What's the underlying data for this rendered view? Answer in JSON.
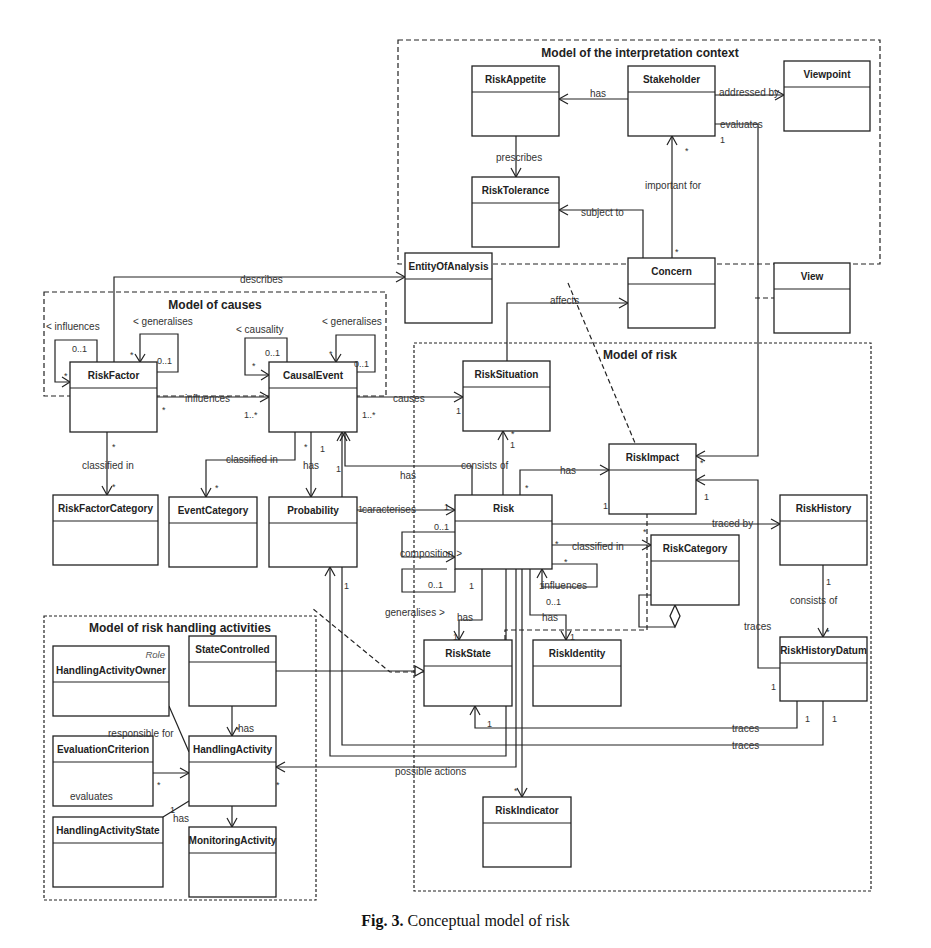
{
  "caption": {
    "label": "Fig. 3.",
    "text": "Conceptual model of risk"
  },
  "packages": [
    {
      "id": "ctx",
      "title": "Model of the interpretation context",
      "x": 398,
      "y": 40,
      "w": 482,
      "h": 224,
      "style": "dash",
      "tx": 640,
      "ty": 57
    },
    {
      "id": "causes",
      "title": "Model of causes",
      "x": 44,
      "y": 292,
      "w": 342,
      "h": 104,
      "style": "dash",
      "tx": 215,
      "ty": 309
    },
    {
      "id": "risk",
      "title": "Model of risk",
      "x": 414,
      "y": 343,
      "w": 457,
      "h": 548,
      "style": "dot",
      "tx": 640,
      "ty": 359
    },
    {
      "id": "handling",
      "title": "Model of risk handling activities",
      "x": 44,
      "y": 616,
      "w": 272,
      "h": 284,
      "style": "dot",
      "tx": 180,
      "ty": 632
    }
  ],
  "classes": [
    {
      "id": "RiskAppetite",
      "name": "RiskAppetite",
      "x": 472,
      "y": 66,
      "w": 87,
      "h": 70
    },
    {
      "id": "Stakeholder",
      "name": "Stakeholder",
      "x": 628,
      "y": 66,
      "w": 87,
      "h": 70
    },
    {
      "id": "Viewpoint",
      "name": "Viewpoint",
      "x": 784,
      "y": 61,
      "w": 86,
      "h": 70
    },
    {
      "id": "RiskTolerance",
      "name": "RiskTolerance",
      "x": 472,
      "y": 177,
      "w": 87,
      "h": 70
    },
    {
      "id": "EntityOfAnalysis",
      "name": "EntityOfAnalysis",
      "x": 405,
      "y": 253,
      "w": 87,
      "h": 70
    },
    {
      "id": "Concern",
      "name": "Concern",
      "x": 628,
      "y": 258,
      "w": 87,
      "h": 70
    },
    {
      "id": "View",
      "name": "View",
      "x": 774,
      "y": 263,
      "w": 76,
      "h": 70
    },
    {
      "id": "RiskFactor",
      "name": "RiskFactor",
      "x": 70,
      "y": 362,
      "w": 87,
      "h": 70
    },
    {
      "id": "CausalEvent",
      "name": "CausalEvent",
      "x": 269,
      "y": 362,
      "w": 88,
      "h": 70
    },
    {
      "id": "RiskSituation",
      "name": "RiskSituation",
      "x": 463,
      "y": 361,
      "w": 87,
      "h": 70
    },
    {
      "id": "RiskImpact",
      "name": "RiskImpact",
      "x": 609,
      "y": 444,
      "w": 87,
      "h": 70
    },
    {
      "id": "RiskFactorCategory",
      "name": "RiskFactorCategory",
      "x": 53,
      "y": 495,
      "w": 105,
      "h": 70
    },
    {
      "id": "EventCategory",
      "name": "EventCategory",
      "x": 169,
      "y": 497,
      "w": 88,
      "h": 70
    },
    {
      "id": "Probability",
      "name": "Probability",
      "x": 269,
      "y": 497,
      "w": 88,
      "h": 70
    },
    {
      "id": "Risk",
      "name": "Risk",
      "x": 455,
      "y": 495,
      "w": 97,
      "h": 74
    },
    {
      "id": "RiskHistory",
      "name": "RiskHistory",
      "x": 780,
      "y": 495,
      "w": 87,
      "h": 70
    },
    {
      "id": "RiskCategory",
      "name": "RiskCategory",
      "x": 651,
      "y": 535,
      "w": 88,
      "h": 70
    },
    {
      "id": "RiskState",
      "name": "RiskState",
      "x": 424,
      "y": 640,
      "w": 88,
      "h": 66
    },
    {
      "id": "RiskIdentity",
      "name": "RiskIdentity",
      "x": 533,
      "y": 640,
      "w": 88,
      "h": 66
    },
    {
      "id": "RiskHistoryDatum",
      "name": "RiskHistoryDatum",
      "x": 780,
      "y": 637,
      "w": 87,
      "h": 64
    },
    {
      "id": "HandlingActivityOwner",
      "name": "HandlingActivityOwner",
      "stereotype": "Role",
      "x": 53,
      "y": 646,
      "w": 116,
      "h": 70
    },
    {
      "id": "StateControlled",
      "name": "StateControlled",
      "x": 189,
      "y": 636,
      "w": 87,
      "h": 70
    },
    {
      "id": "EvaluationCriterion",
      "name": "EvaluationCriterion",
      "x": 53,
      "y": 736,
      "w": 100,
      "h": 70
    },
    {
      "id": "HandlingActivity",
      "name": "HandlingActivity",
      "x": 189,
      "y": 736,
      "w": 87,
      "h": 70
    },
    {
      "id": "HandlingActivityState",
      "name": "HandlingActivityState",
      "x": 53,
      "y": 817,
      "w": 110,
      "h": 70
    },
    {
      "id": "MonitoringActivity",
      "name": "MonitoringActivity",
      "x": 189,
      "y": 827,
      "w": 87,
      "h": 70
    },
    {
      "id": "RiskIndicator",
      "name": "RiskIndicator",
      "x": 483,
      "y": 797,
      "w": 88,
      "h": 70
    }
  ],
  "associations": [
    {
      "label": "has",
      "lx": 590,
      "ly": 88,
      "path": "M628,99 L559,99",
      "arrow": "open",
      "ax": 559,
      "ay": 99,
      "dir": "left"
    },
    {
      "label": "addressed by",
      "lx": 719,
      "ly": 87,
      "path": "M715,95 L784,95",
      "arrow": "open",
      "ax": 784,
      "ay": 95,
      "dir": "right"
    },
    {
      "label": "evaluates",
      "lx": 720,
      "ly": 119,
      "path": "M715,124 L758,124 L758,456 L696,456",
      "arrow": "open",
      "ax": 696,
      "ay": 456,
      "dir": "left"
    },
    {
      "label": "prescribes",
      "lx": 496,
      "ly": 152,
      "path": "M516,136 L516,177",
      "arrow": "open",
      "ax": 516,
      "ay": 177,
      "dir": "down"
    },
    {
      "label": "important for",
      "lx": 645,
      "ly": 180,
      "path": "M672,258 L672,136",
      "arrow": "open",
      "ax": 672,
      "ay": 136,
      "dir": "up"
    },
    {
      "label": "subject to",
      "lx": 581,
      "ly": 207,
      "path": "M643,258 L643,210 L559,210",
      "arrow": "open",
      "ax": 559,
      "ay": 210,
      "dir": "left"
    },
    {
      "label": "describes",
      "lx": 240,
      "ly": 274,
      "path": "M114,362 L114,277 L405,277",
      "arrow": "open",
      "ax": 405,
      "ay": 277,
      "dir": "right"
    },
    {
      "label": "affects",
      "lx": 550,
      "ly": 295,
      "path": "M507,361 L507,303 L628,303",
      "arrow": "open",
      "ax": 628,
      "ay": 303,
      "dir": "right"
    },
    {
      "label": "influences",
      "lx": 185,
      "ly": 393,
      "path": "M157,397 L269,397",
      "arrow": "open",
      "ax": 269,
      "ay": 397,
      "dir": "right"
    },
    {
      "label": "causes",
      "lx": 393,
      "ly": 393,
      "path": "M357,397 L463,397",
      "arrow": "open",
      "ax": 463,
      "ay": 397,
      "dir": "right"
    },
    {
      "label": "classified in",
      "lx": 82,
      "ly": 460,
      "path": "M107,432 L107,495",
      "arrow": "open",
      "ax": 107,
      "ay": 495,
      "dir": "down"
    },
    {
      "label": "classified in",
      "lx": 226,
      "ly": 454,
      "path": "M295,432 L295,460 L206,460 L206,497",
      "arrow": "open",
      "ax": 206,
      "ay": 497,
      "dir": "down"
    },
    {
      "label": "has",
      "lx": 303,
      "ly": 460,
      "path": "M311,432 L311,497",
      "arrow": "open",
      "ax": 311,
      "ay": 497,
      "dir": "down"
    },
    {
      "label": "has",
      "lx": 400,
      "ly": 470,
      "path": "M472,495 L472,466 L345,466 L345,432",
      "arrow": "open",
      "ax": 345,
      "ay": 432,
      "dir": "up"
    },
    {
      "label": "consists of",
      "lx": 461,
      "ly": 460,
      "path": "M503,495 L503,431",
      "arrow": "open",
      "ax": 503,
      "ay": 431,
      "dir": "up"
    },
    {
      "label": "has",
      "lx": 560,
      "ly": 465,
      "path": "M520,495 L520,470 L609,470",
      "arrow": "open",
      "ax": 609,
      "ay": 470,
      "dir": "right"
    },
    {
      "label": "caracterises",
      "lx": 362,
      "ly": 504,
      "path": "M357,510 L455,510",
      "arrow": "open",
      "ax": 455,
      "ay": 510,
      "dir": "right"
    },
    {
      "label": "traced by",
      "lx": 712,
      "ly": 518,
      "path": "M552,524 L780,524",
      "arrow": "open",
      "ax": 780,
      "ay": 524,
      "dir": "right"
    },
    {
      "label": "classified in",
      "lx": 572,
      "ly": 541,
      "path": "M552,545 L651,545",
      "arrow": "open",
      "ax": 651,
      "ay": 545,
      "dir": "right"
    },
    {
      "label": "composition >",
      "lx": 400,
      "ly": 548,
      "path": "M455,532 L402,532 L402,557 L455,557",
      "arrow": "open",
      "ax": 455,
      "ay": 557,
      "dir": "right"
    },
    {
      "label": "influences",
      "lx": 542,
      "ly": 580,
      "path": "M552,564 L597,564 L597,587 L542,587 L542,569",
      "arrow": "open",
      "ax": 542,
      "ay": 569,
      "dir": "up"
    },
    {
      "label": "generalises >",
      "lx": 385,
      "ly": 607,
      "path": "M455,569 L455,592 L402,592 L402,569 L447,569",
      "arrow": "none"
    },
    {
      "label": "has",
      "lx": 457,
      "ly": 612,
      "path": "M482,569 L482,620 L459,620 L459,640",
      "arrow": "open",
      "ax": 459,
      "ay": 640,
      "dir": "down"
    },
    {
      "label": "has",
      "lx": 542,
      "ly": 612,
      "path": "M530,569 L530,615 L566,615 L566,640",
      "arrow": "open",
      "ax": 566,
      "ay": 640,
      "dir": "down"
    },
    {
      "label": "consists of",
      "lx": 790,
      "ly": 595,
      "path": "M823,565 L823,637",
      "arrow": "open",
      "ax": 823,
      "ay": 637,
      "dir": "down"
    },
    {
      "label": "traces",
      "lx": 744,
      "ly": 621,
      "path": "M780,668 L758,668 L758,480 L696,480",
      "arrow": "open",
      "ax": 696,
      "ay": 480,
      "dir": "left"
    },
    {
      "label": "traces",
      "lx": 732,
      "ly": 723,
      "path": "M797,701 L797,728 L475,728 L475,706",
      "arrow": "open",
      "ax": 475,
      "ay": 706,
      "dir": "up"
    },
    {
      "label": "traces",
      "lx": 732,
      "ly": 740,
      "path": "M823,701 L823,745 L342,745 L342,432",
      "arrow": "open",
      "ax": 342,
      "ay": 432,
      "dir": "up"
    },
    {
      "label": "possible actions",
      "lx": 395,
      "ly": 766,
      "path": "M516,569 L516,767 L276,767",
      "arrow": "open",
      "ax": 276,
      "ay": 767,
      "dir": "left"
    },
    {
      "label": "",
      "lx": 0,
      "ly": 0,
      "path": "M522,569 L522,797",
      "arrow": "open",
      "ax": 522,
      "ay": 797,
      "dir": "down"
    },
    {
      "label": "",
      "lx": 0,
      "ly": 0,
      "path": "M506,569 L506,756 L330,756 L330,567",
      "arrow": "open",
      "ax": 330,
      "ay": 567,
      "dir": "up"
    },
    {
      "label": "",
      "lx": 0,
      "ly": 0,
      "path": "M276,671 L424,671",
      "arrow": "triangle",
      "ax": 424,
      "ay": 671,
      "dir": "right"
    },
    {
      "label": "has",
      "lx": 238,
      "ly": 723,
      "path": "M232,706 L232,736",
      "arrow": "open",
      "ax": 232,
      "ay": 736,
      "dir": "down"
    },
    {
      "label": "responsible for",
      "lx": 108,
      "ly": 728,
      "path": "M169,706 L189,752",
      "arrow": "none"
    },
    {
      "label": "evaluates",
      "lx": 70,
      "ly": 791,
      "path": "M153,773 L189,773",
      "arrow": "open",
      "ax": 189,
      "ay": 773,
      "dir": "right"
    },
    {
      "label": "has",
      "lx": 173,
      "ly": 813,
      "path": "M189,801 L163,817",
      "arrow": "none"
    },
    {
      "label": "",
      "lx": 0,
      "ly": 0,
      "path": "M232,806 L232,827",
      "arrow": "open",
      "ax": 232,
      "ay": 827,
      "dir": "down"
    }
  ],
  "self_loops": [
    {
      "label": "< influences",
      "lx": 46,
      "ly": 330
    },
    {
      "label": "< generalises",
      "lx": 133,
      "ly": 325
    },
    {
      "label": "< causality",
      "lx": 236,
      "ly": 333
    },
    {
      "label": "< generalises",
      "lx": 322,
      "ly": 325
    }
  ],
  "dependencies": [
    {
      "path": "M568,283 L635,443"
    },
    {
      "path": "M755,298 L774,298"
    },
    {
      "path": "M424,672 L390,672 L312,608"
    },
    {
      "path": "M505,640 L505,630 L647,630 L647,514"
    }
  ],
  "multiplicities": [
    {
      "t": "*",
      "x": 685,
      "y": 147
    },
    {
      "t": "1",
      "x": 720,
      "y": 136
    },
    {
      "t": "*",
      "x": 675,
      "y": 248
    },
    {
      "t": "0..1",
      "x": 72,
      "y": 345
    },
    {
      "t": "*",
      "x": 64,
      "y": 372
    },
    {
      "t": "*",
      "x": 130,
      "y": 351
    },
    {
      "t": "0..1",
      "x": 157,
      "y": 357
    },
    {
      "t": "0..1",
      "x": 265,
      "y": 349
    },
    {
      "t": "*",
      "x": 252,
      "y": 362
    },
    {
      "t": "*",
      "x": 329,
      "y": 350
    },
    {
      "t": "0..1",
      "x": 354,
      "y": 360
    },
    {
      "t": "*",
      "x": 162,
      "y": 406
    },
    {
      "t": "1..*",
      "x": 244,
      "y": 411
    },
    {
      "t": "1..*",
      "x": 362,
      "y": 411
    },
    {
      "t": "1",
      "x": 456,
      "y": 407
    },
    {
      "t": "*",
      "x": 112,
      "y": 443
    },
    {
      "t": "*",
      "x": 112,
      "y": 483
    },
    {
      "t": "*",
      "x": 215,
      "y": 484
    },
    {
      "t": "*",
      "x": 304,
      "y": 443
    },
    {
      "t": "1",
      "x": 320,
      "y": 445
    },
    {
      "t": "1",
      "x": 336,
      "y": 465
    },
    {
      "t": "*",
      "x": 511,
      "y": 430
    },
    {
      "t": "1",
      "x": 510,
      "y": 441
    },
    {
      "t": "*",
      "x": 525,
      "y": 484
    },
    {
      "t": "1",
      "x": 603,
      "y": 502
    },
    {
      "t": "1",
      "x": 358,
      "y": 505
    },
    {
      "t": "1",
      "x": 444,
      "y": 503
    },
    {
      "t": "0..1",
      "x": 434,
      "y": 523
    },
    {
      "t": "*",
      "x": 555,
      "y": 540
    },
    {
      "t": "*",
      "x": 643,
      "y": 528
    },
    {
      "t": "*",
      "x": 564,
      "y": 558
    },
    {
      "t": "0..1",
      "x": 546,
      "y": 598
    },
    {
      "t": "0..1",
      "x": 428,
      "y": 581
    },
    {
      "t": "1",
      "x": 469,
      "y": 582
    },
    {
      "t": "1",
      "x": 453,
      "y": 633
    },
    {
      "t": "1",
      "x": 570,
      "y": 633
    },
    {
      "t": "1",
      "x": 539,
      "y": 582
    },
    {
      "t": "*",
      "x": 700,
      "y": 459
    },
    {
      "t": "1",
      "x": 704,
      "y": 493
    },
    {
      "t": "1",
      "x": 826,
      "y": 578
    },
    {
      "t": "*",
      "x": 826,
      "y": 628
    },
    {
      "t": "1",
      "x": 771,
      "y": 683
    },
    {
      "t": "1",
      "x": 805,
      "y": 715
    },
    {
      "t": "1",
      "x": 832,
      "y": 715
    },
    {
      "t": "1",
      "x": 487,
      "y": 720
    },
    {
      "t": "*",
      "x": 514,
      "y": 787
    },
    {
      "t": "1",
      "x": 344,
      "y": 582
    },
    {
      "t": "*",
      "x": 236,
      "y": 726
    },
    {
      "t": "*",
      "x": 276,
      "y": 781
    },
    {
      "t": "*",
      "x": 157,
      "y": 781
    },
    {
      "t": "1",
      "x": 170,
      "y": 806
    }
  ]
}
